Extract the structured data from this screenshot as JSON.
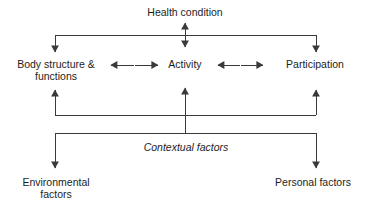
{
  "diagram": {
    "stroke_color": "#3a3a3a",
    "text_color": "#1d1d1d",
    "background": "#ffffff",
    "nodes": {
      "health_condition": {
        "label": "Health condition"
      },
      "body_structure": {
        "line1": "Body structure &",
        "line2": "functions"
      },
      "activity": {
        "label": "Activity"
      },
      "participation": {
        "label": "Participation"
      },
      "contextual_factors": {
        "label": "Contextual factors"
      },
      "environmental_factors": {
        "line1": "Environmental",
        "line2": "factors"
      },
      "personal_factors": {
        "label": "Personal factors"
      }
    },
    "connectors": [
      {
        "name": "health-to-bus",
        "type": "double-vertical",
        "from": "health_condition",
        "to": "upper-bus"
      },
      {
        "name": "bus-to-body",
        "type": "arrow-down",
        "to": "body_structure"
      },
      {
        "name": "bus-to-activity",
        "type": "arrow-down",
        "to": "activity"
      },
      {
        "name": "bus-to-participation",
        "type": "arrow-down",
        "to": "participation"
      },
      {
        "name": "body-activity",
        "type": "double-horizontal",
        "from": "body_structure",
        "to": "activity"
      },
      {
        "name": "activity-participation",
        "type": "double-horizontal",
        "from": "activity",
        "to": "participation"
      },
      {
        "name": "lower-bus-to-body",
        "type": "arrow-up",
        "to": "body_structure"
      },
      {
        "name": "lower-bus-to-activity",
        "type": "arrow-up",
        "to": "activity"
      },
      {
        "name": "lower-bus-to-participation",
        "type": "arrow-up",
        "to": "participation"
      },
      {
        "name": "context-to-lower-bus",
        "type": "arrow-up",
        "from": "contextual_factors"
      },
      {
        "name": "context-to-environmental",
        "type": "arrow-down",
        "to": "environmental_factors"
      },
      {
        "name": "context-to-personal",
        "type": "arrow-down",
        "to": "personal_factors"
      }
    ]
  }
}
